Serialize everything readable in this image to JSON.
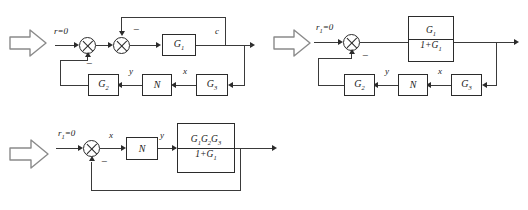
{
  "figure": {
    "kind": "block-diagram-reduction",
    "diagram_count": 3
  },
  "icons": {
    "step_arrow": "block-arrow-right"
  },
  "symbols": {
    "minus": "−",
    "equals_zero": "=0"
  },
  "diagram1": {
    "name": "original-block-diagram",
    "input_label": "r=0",
    "output_label": "c",
    "blocks": [
      {
        "id": "g1",
        "label": "G",
        "sub": "1"
      },
      {
        "id": "g2",
        "label": "G",
        "sub": "2"
      },
      {
        "id": "n",
        "label": "N",
        "sub": ""
      },
      {
        "id": "g3",
        "label": "G",
        "sub": "3"
      }
    ],
    "signals": {
      "y": "y",
      "x": "x"
    },
    "summers": [
      {
        "id": "sum-outer",
        "sign": "−"
      },
      {
        "id": "sum-inner",
        "sign": "−"
      }
    ]
  },
  "diagram2": {
    "name": "inner-loop-reduced-diagram",
    "input_label": "r",
    "input_sub": "1",
    "input_suffix": "=0",
    "forward_block": {
      "numerator": "G",
      "numerator_sub": "1",
      "denominator_prefix": "1+G",
      "denominator_sub": "1"
    },
    "blocks": [
      {
        "id": "g2",
        "label": "G",
        "sub": "2"
      },
      {
        "id": "n",
        "label": "N",
        "sub": ""
      },
      {
        "id": "g3",
        "label": "G",
        "sub": "3"
      }
    ],
    "signals": {
      "y": "y",
      "x": "x"
    },
    "summers": [
      {
        "id": "sum-main",
        "sign": "−"
      }
    ]
  },
  "diagram3": {
    "name": "final-reduced-diagram",
    "input_label": "r",
    "input_sub": "1",
    "input_suffix": "=0",
    "blocks": [
      {
        "id": "n",
        "label": "N",
        "sub": ""
      }
    ],
    "forward_block": {
      "numerator": "G",
      "numerator_subs": [
        "1",
        "2",
        "3"
      ],
      "denominator_prefix": "1+G",
      "denominator_sub": "1"
    },
    "signals": {
      "x": "x",
      "y": "y"
    },
    "summers": [
      {
        "id": "sum-main",
        "sign": "−"
      }
    ]
  }
}
